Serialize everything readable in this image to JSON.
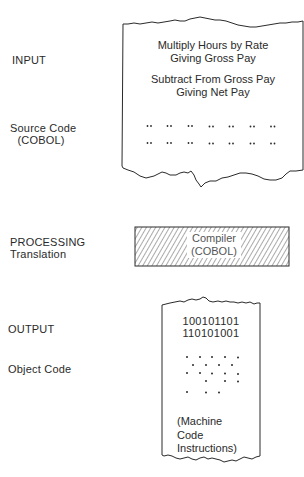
{
  "stages": {
    "input": {
      "title": "INPUT",
      "subtitle_line1": "Source Code",
      "subtitle_line2": "(COBOL)",
      "document": {
        "line1": "Multiply Hours by Rate",
        "line2": "Giving Gross Pay",
        "line3": "Subtract From Gross Pay",
        "line4": "Giving Net Pay",
        "dot_rows": 2,
        "dot_pairs_per_row": 7
      }
    },
    "processing": {
      "title": "PROCESSING",
      "subtitle": "Translation",
      "box": {
        "line1": "Compiler",
        "line2": "(COBOL)",
        "fill": "hatched"
      }
    },
    "output": {
      "title": "OUTPUT",
      "subtitle": "Object Code",
      "document": {
        "binary_line1": "100101101",
        "binary_line2": "110101001",
        "note_line1": "(Machine",
        "note_line2": "Code",
        "note_line3": "Instructions)"
      }
    }
  },
  "colors": {
    "ink": "#2a2a2a",
    "background": "#ffffff"
  }
}
